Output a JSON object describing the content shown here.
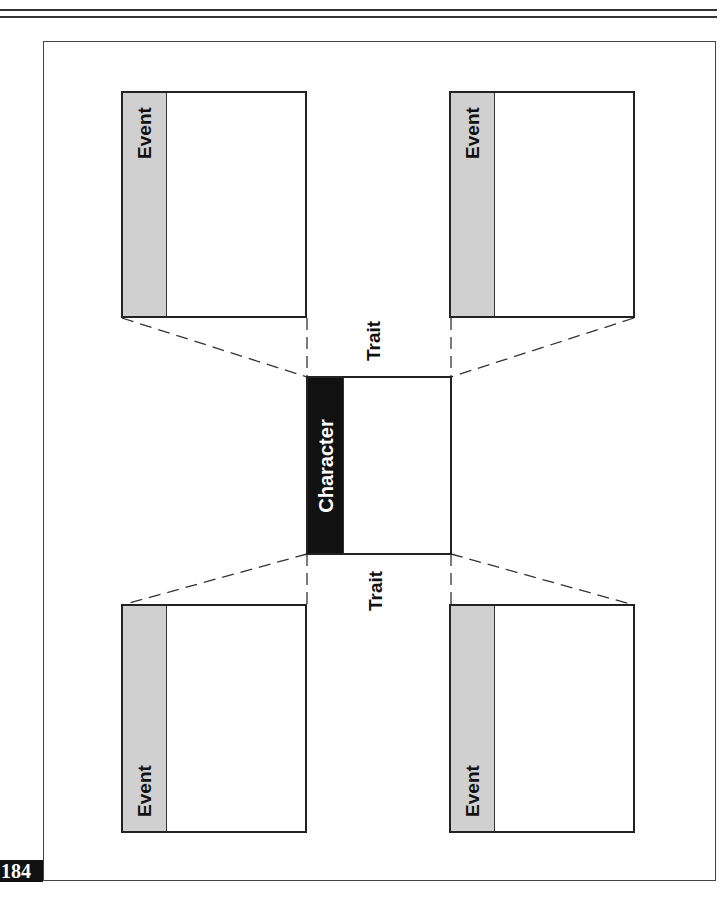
{
  "diagram": {
    "center": {
      "label": "Character"
    },
    "traits": [
      {
        "position": "top",
        "label": "Trait"
      },
      {
        "position": "bottom",
        "label": "Trait"
      }
    ],
    "events": [
      {
        "position": "top-left",
        "label": "Event"
      },
      {
        "position": "top-right",
        "label": "Event"
      },
      {
        "position": "bottom-left",
        "label": "Event"
      },
      {
        "position": "bottom-right",
        "label": "Event"
      }
    ]
  },
  "page": {
    "number": "184"
  },
  "colors": {
    "event_strip": "#d0d0d0",
    "character_strip": "#111111",
    "border": "#222222"
  }
}
